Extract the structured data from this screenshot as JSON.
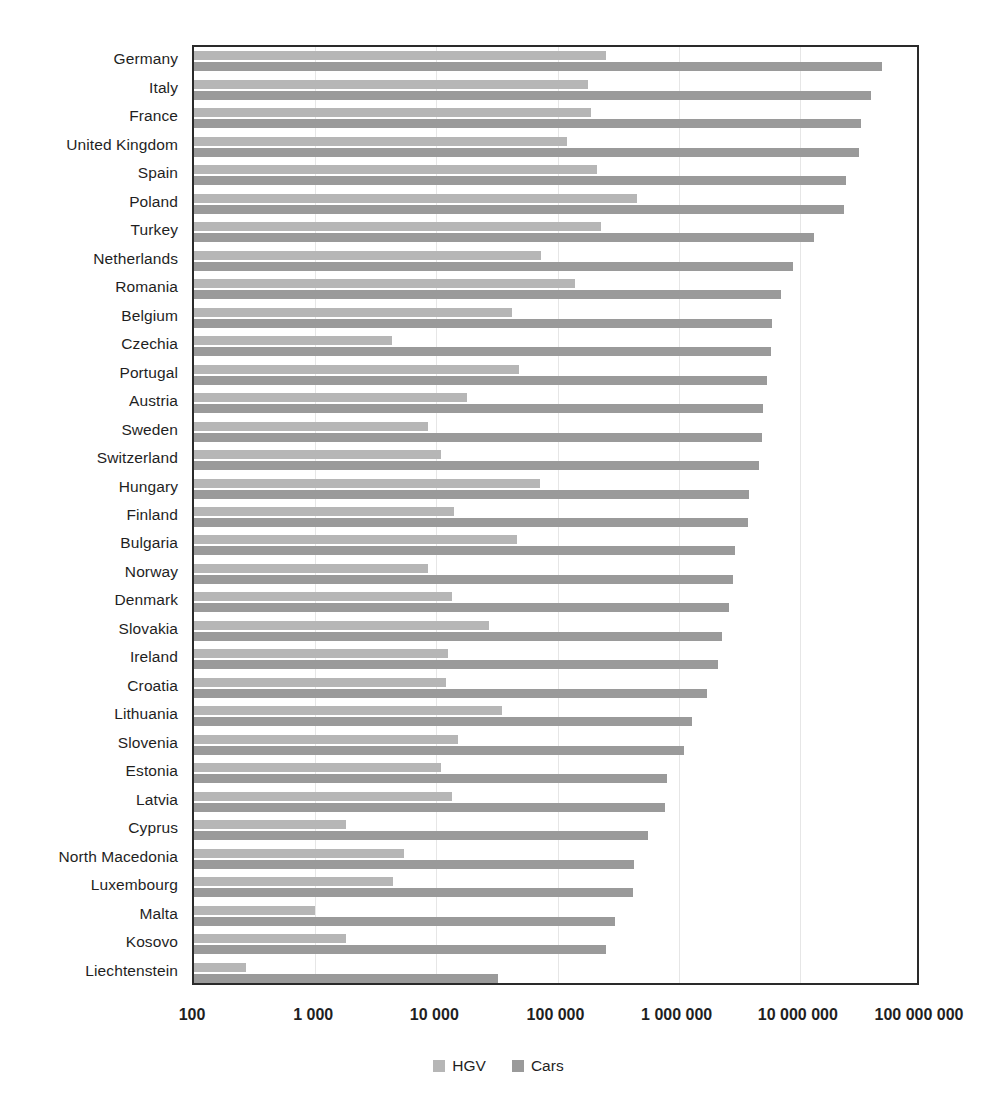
{
  "chart_data": {
    "type": "bar",
    "orientation": "horizontal",
    "title": "",
    "subtitle": "",
    "xlabel": "",
    "ylabel": "",
    "xscale": "log",
    "xlim": [
      100,
      100000000
    ],
    "grid": true,
    "legend_position": "bottom",
    "x_tick_labels": [
      "100",
      "1 000",
      "10 000",
      "100 000",
      "1 000 000",
      "10 000 000",
      "100 000 000"
    ],
    "x_tick_values": [
      100,
      1000,
      10000,
      100000,
      1000000,
      10000000,
      100000000
    ],
    "categories": [
      "Germany",
      "Italy",
      "France",
      "United Kingdom",
      "Spain",
      "Poland",
      "Turkey",
      "Netherlands",
      "Romania",
      "Belgium",
      "Czechia",
      "Portugal",
      "Austria",
      "Sweden",
      "Switzerland",
      "Hungary",
      "Finland",
      "Bulgaria",
      "Norway",
      "Denmark",
      "Slovakia",
      "Ireland",
      "Croatia",
      "Lithuania",
      "Slovenia",
      "Estonia",
      "Latvia",
      "Cyprus",
      "North Macedonia",
      "Luxembourg",
      "Malta",
      "Kosovo",
      "Liechtenstein"
    ],
    "series": [
      {
        "name": "HGV",
        "color": "#b6b6b6",
        "values": [
          250000,
          180000,
          190000,
          120000,
          210000,
          450000,
          230000,
          73000,
          140000,
          42000,
          4300,
          48000,
          18000,
          8500,
          11000,
          72000,
          14000,
          46000,
          8600,
          13500,
          27000,
          12500,
          12000,
          35000,
          15000,
          11000,
          13500,
          1800,
          5400,
          4400,
          1000,
          1800,
          270
        ]
      },
      {
        "name": "Cars",
        "color": "#9a9a9a",
        "values": [
          48000000,
          39000000,
          32000000,
          31000000,
          24000000,
          23000000,
          13000000,
          8700000,
          7000000,
          5900000,
          5800000,
          5400000,
          5000000,
          4900000,
          4600000,
          3800000,
          3700000,
          2900000,
          2800000,
          2600000,
          2300000,
          2100000,
          1700000,
          1300000,
          1100000,
          800000,
          770000,
          560000,
          430000,
          420000,
          300000,
          250000,
          32000
        ]
      }
    ]
  },
  "legend": {
    "items": [
      {
        "label": "HGV",
        "color": "#b6b6b6"
      },
      {
        "label": "Cars",
        "color": "#9a9a9a"
      }
    ]
  }
}
